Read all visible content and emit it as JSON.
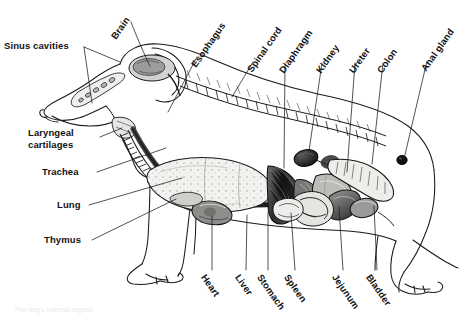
{
  "figure": {
    "background_color": "#ffffff",
    "ink_color": "#1a1a1a",
    "caption_faint": "The dog's internal organs"
  },
  "labels": {
    "brain": "Brain",
    "sinus_cavities": "Sinus cavities",
    "laryngeal_cartilages_line1": "Laryngeal",
    "laryngeal_cartilages_line2": "cartilages",
    "trachea": "Trachea",
    "lung": "Lung",
    "thymus": "Thymus",
    "esophagus": "Esophagus",
    "spinal_cord": "Spinal cord",
    "diaphragm": "Diaphragm",
    "kidney": "Kidney",
    "ureter": "Ureter",
    "colon": "Colon",
    "anal_gland": "Anal gland",
    "heart": "Heart",
    "liver": "Liver",
    "stomach": "Stomach",
    "spleen": "Spleen",
    "jejunum": "Jejunum",
    "bladder": "Bladder"
  },
  "organs": [
    {
      "name": "brain",
      "label": "Brain"
    },
    {
      "name": "sinus-cavities",
      "label": "Sinus cavities"
    },
    {
      "name": "laryngeal-cartilages",
      "label": "Laryngeal cartilages"
    },
    {
      "name": "trachea",
      "label": "Trachea"
    },
    {
      "name": "lung",
      "label": "Lung"
    },
    {
      "name": "thymus",
      "label": "Thymus"
    },
    {
      "name": "esophagus",
      "label": "Esophagus"
    },
    {
      "name": "spinal-cord",
      "label": "Spinal cord"
    },
    {
      "name": "diaphragm",
      "label": "Diaphragm"
    },
    {
      "name": "kidney",
      "label": "Kidney"
    },
    {
      "name": "ureter",
      "label": "Ureter"
    },
    {
      "name": "colon",
      "label": "Colon"
    },
    {
      "name": "anal-gland",
      "label": "Anal gland"
    },
    {
      "name": "heart",
      "label": "Heart"
    },
    {
      "name": "liver",
      "label": "Liver"
    },
    {
      "name": "stomach",
      "label": "Stomach"
    },
    {
      "name": "spleen",
      "label": "Spleen"
    },
    {
      "name": "jejunum",
      "label": "Jejunum"
    },
    {
      "name": "bladder",
      "label": "Bladder"
    }
  ]
}
